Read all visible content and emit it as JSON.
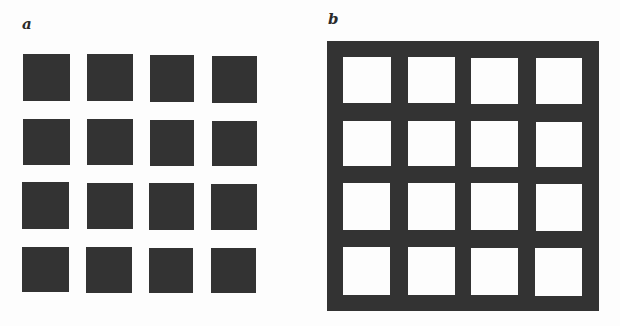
{
  "figure": {
    "panels": [
      {
        "label": "a",
        "description": "4x4 grid of dark squares on white background",
        "rows": 4,
        "cols": 4,
        "element_color": "#333333",
        "background_color": "#fdfdfd"
      },
      {
        "label": "b",
        "description": "4x4 grid of white squares within a dark grid (Hermann grid)",
        "rows": 4,
        "cols": 4,
        "element_color": "#fdfdfd",
        "background_color": "#333333"
      }
    ]
  }
}
